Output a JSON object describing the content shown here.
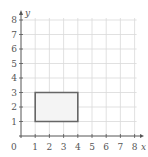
{
  "chart_data": {
    "type": "diagram",
    "title": "",
    "xlabel": "x",
    "ylabel": "y",
    "xlim": [
      0,
      8
    ],
    "ylim": [
      0,
      8
    ],
    "grid": true,
    "origin_label": "0",
    "x_ticks": [
      "1",
      "2",
      "3",
      "4",
      "5",
      "6",
      "7",
      "8"
    ],
    "y_ticks": [
      "1",
      "2",
      "3",
      "4",
      "5",
      "6",
      "7",
      "8"
    ],
    "shapes": [
      {
        "type": "rectangle",
        "vertices": [
          [
            1,
            1
          ],
          [
            4,
            1
          ],
          [
            4,
            3
          ],
          [
            1,
            3
          ]
        ],
        "stroke": "#666666",
        "fill": "#f4f4f4"
      }
    ]
  },
  "colors": {
    "grid": "#d9d9d9",
    "axis": "#555555",
    "shape_stroke": "#666666",
    "shape_fill": "#f4f4f4"
  }
}
